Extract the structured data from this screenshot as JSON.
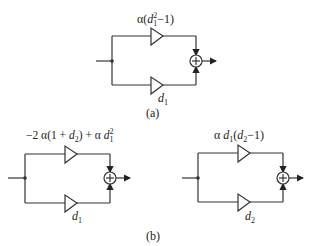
{
  "figure_a": {
    "caption": "(a)",
    "top_gain": {
      "prefix": "α(",
      "var": "d",
      "sub": "1",
      "sup": "2",
      "suffix": "−1)"
    },
    "bottom_gain": {
      "var": "d",
      "sub": "1"
    },
    "sum_symbol": "+"
  },
  "figure_b": {
    "caption": "(b)",
    "left": {
      "top_gain": {
        "text1": "−2 α(1 + ",
        "var1": "d",
        "sub1": "2",
        "text2": ") + α ",
        "var2": "d",
        "sub2": "1",
        "sup2": "2"
      },
      "bottom_gain": {
        "var": "d",
        "sub": "1"
      },
      "sum_symbol": "+"
    },
    "right": {
      "top_gain": {
        "text1": "α ",
        "var1": "d",
        "sub1": "1",
        "text2": "(",
        "var2": "d",
        "sub2": "2",
        "text3": "−1)"
      },
      "bottom_gain": {
        "var": "d",
        "sub": "2"
      },
      "sum_symbol": "+"
    }
  }
}
